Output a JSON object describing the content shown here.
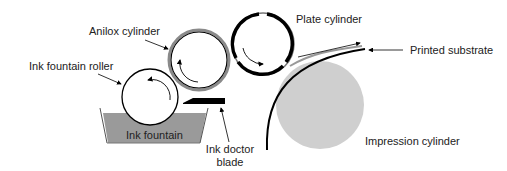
{
  "labels": {
    "anilox": "Anilox cylinder",
    "fountain_roller": "Ink fountain roller",
    "fountain": "Ink fountain",
    "doctor_blade_line1": "Ink doctor",
    "doctor_blade_line2": "blade",
    "plate": "Plate cylinder",
    "substrate": "Printed substrate",
    "impression": "Impression cylinder"
  },
  "colors": {
    "ink": "#000000",
    "fountain_fill": "#9a9a9a",
    "impression_fill": "#cfcfcf",
    "anilox_ring": "#8a8a8a"
  }
}
